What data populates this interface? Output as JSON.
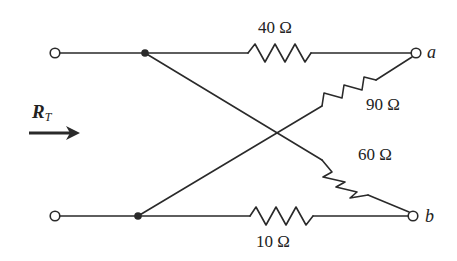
{
  "diagram": {
    "type": "resistor-network",
    "input_label": {
      "main": "R",
      "subscript": "T"
    },
    "arrow_direction": "right",
    "terminals": {
      "left_top": "",
      "left_bottom": "",
      "right_top": "a",
      "right_bottom": "b"
    },
    "resistors": [
      {
        "id": "r-top",
        "label": "40 Ω",
        "from": "left_top_node",
        "to": "a"
      },
      {
        "id": "r-diag-up",
        "label": "90 Ω",
        "from": "left_bottom_node",
        "to": "a"
      },
      {
        "id": "r-diag-down",
        "label": "60 Ω",
        "from": "left_top_node",
        "to": "b"
      },
      {
        "id": "r-bottom",
        "label": "10 Ω",
        "from": "left_bottom_node",
        "to": "b"
      }
    ],
    "colors": {
      "ink": "#2a2a2a",
      "background": "#ffffff"
    }
  }
}
